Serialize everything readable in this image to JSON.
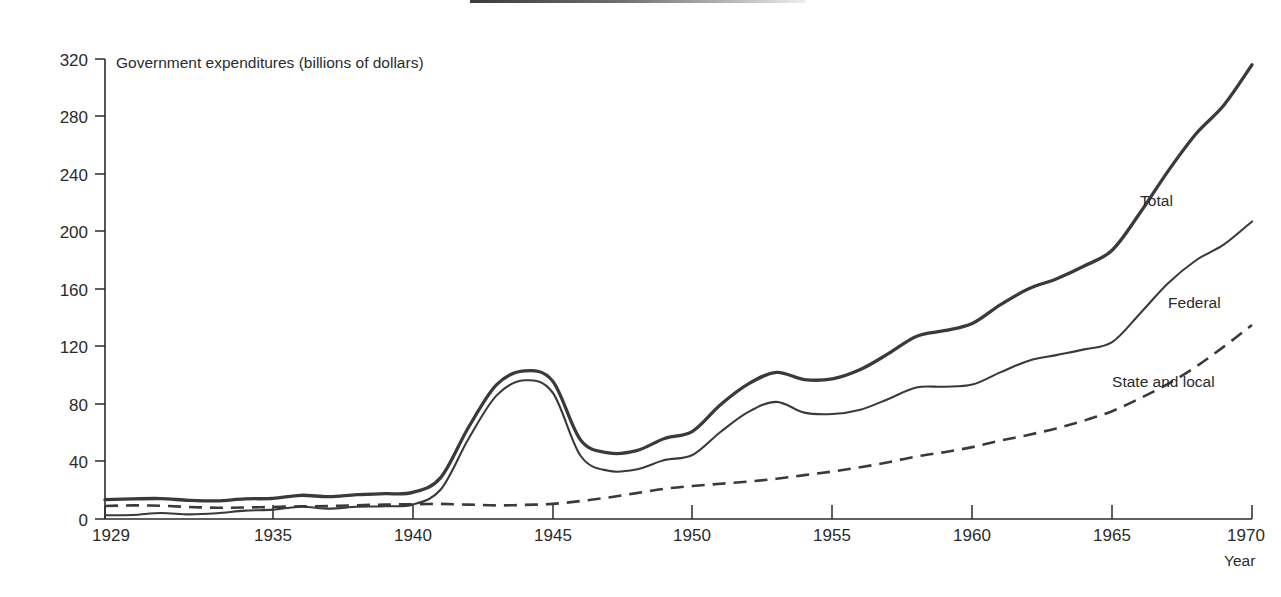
{
  "chart_data": {
    "type": "line",
    "title": "",
    "ylabel": "Government expenditures (billions of dollars)",
    "xlabel": "Year",
    "xlim": [
      1929,
      1970
    ],
    "ylim": [
      0,
      320
    ],
    "grid": false,
    "legend_position": "inline-right-of-series",
    "yticks": [
      0,
      40,
      80,
      120,
      160,
      200,
      240,
      280,
      320
    ],
    "ytick_labels": [
      "0",
      "40",
      "80",
      "120",
      "160",
      "200",
      "240",
      "280",
      "320"
    ],
    "xticks": [
      1929,
      1935,
      1940,
      1945,
      1950,
      1955,
      1960,
      1965,
      1970
    ],
    "xtick_labels": [
      "1929",
      "1935",
      "1940",
      "1945",
      "1950",
      "1955",
      "1960",
      "1965",
      "1970"
    ],
    "x": [
      1929,
      1930,
      1931,
      1932,
      1933,
      1934,
      1935,
      1936,
      1937,
      1938,
      1939,
      1940,
      1941,
      1942,
      1943,
      1944,
      1945,
      1946,
      1947,
      1948,
      1949,
      1950,
      1951,
      1952,
      1953,
      1954,
      1955,
      1956,
      1957,
      1958,
      1959,
      1960,
      1961,
      1962,
      1963,
      1964,
      1965,
      1966,
      1967,
      1968,
      1969,
      1970
    ],
    "series": [
      {
        "name": "Total",
        "style": "solid-thick",
        "color": "#3a3a3a",
        "values": [
          13.5,
          14.0,
          14.2,
          13.0,
          12.6,
          14.0,
          14.3,
          16.5,
          15.5,
          17.0,
          17.6,
          18.5,
          28.8,
          64.0,
          93.5,
          103.0,
          96.0,
          55.0,
          46.0,
          47.5,
          56.0,
          61.0,
          79.5,
          94.0,
          102.0,
          97.0,
          97.5,
          104.0,
          115.0,
          127.0,
          131.0,
          136.0,
          149.0,
          160.0,
          167.0,
          176.0,
          187.0,
          213.0,
          242.0,
          268.0,
          288.0,
          316.0
        ],
        "label": "Total",
        "label_x": 1966,
        "label_y": 218
      },
      {
        "name": "Federal",
        "style": "solid-thin",
        "color": "#3a3a3a",
        "values": [
          2.6,
          2.8,
          4.2,
          3.2,
          4.0,
          5.8,
          6.5,
          8.5,
          7.2,
          8.5,
          8.9,
          10.0,
          20.5,
          56.0,
          86.0,
          96.5,
          88.0,
          44.0,
          33.5,
          34.5,
          41.0,
          44.5,
          60.5,
          74.5,
          81.5,
          74.0,
          73.0,
          76.0,
          83.5,
          91.5,
          92.0,
          93.5,
          102.0,
          110.0,
          114.0,
          118.0,
          123.0,
          143.0,
          164.0,
          180.0,
          191.0,
          207.0
        ],
        "label": "Federal",
        "label_x": 1967,
        "label_y": 147
      },
      {
        "name": "State and local",
        "style": "dashed",
        "color": "#3a3a3a",
        "values": [
          9.0,
          9.5,
          9.2,
          8.4,
          7.8,
          8.0,
          8.4,
          8.8,
          9.0,
          9.6,
          10.0,
          10.3,
          10.5,
          10.0,
          9.5,
          9.8,
          10.5,
          12.5,
          15.0,
          18.0,
          21.0,
          23.0,
          24.5,
          26.0,
          28.0,
          30.5,
          33.0,
          36.0,
          39.5,
          43.5,
          46.5,
          50.0,
          54.5,
          58.5,
          63.0,
          68.5,
          75.0,
          84.0,
          94.0,
          106.0,
          120.0,
          135.0
        ],
        "label": "State and local",
        "label_x": 1965,
        "label_y": 92
      }
    ]
  },
  "axis": {
    "y_axis_caption": "Government expenditures (billions of dollars)",
    "x_axis_caption": "Year"
  }
}
